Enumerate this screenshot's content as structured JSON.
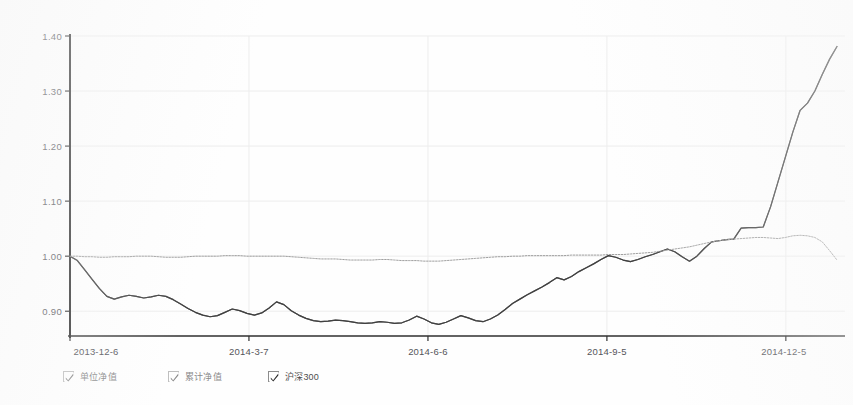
{
  "chart_data": {
    "type": "line",
    "title": "",
    "xlabel": "",
    "ylabel": "",
    "ylim": [
      0.855,
      1.4
    ],
    "xlim": [
      "2013-12-6",
      "2014-12-19"
    ],
    "grid": true,
    "legend_position": "bottom",
    "y_ticks": [
      "1.40",
      "1.30",
      "1.20",
      "1.10",
      "1.00",
      "0.90"
    ],
    "y_tick_values": [
      1.4,
      1.3,
      1.2,
      1.1,
      1.0,
      0.9
    ],
    "x_ticks": [
      "2013-12-6",
      "2014-3-7",
      "2014-6-6",
      "2014-9-5",
      "2014-12-5"
    ],
    "x_tick_positions": [
      0.0,
      0.2333,
      0.4667,
      0.7,
      0.9333
    ],
    "series": [
      {
        "name": "单位净值",
        "style": "solid",
        "color": "#3d3d3d",
        "values": [
          1.0,
          0.992,
          0.975,
          0.958,
          0.941,
          0.927,
          0.922,
          0.926,
          0.929,
          0.927,
          0.924,
          0.926,
          0.929,
          0.927,
          0.921,
          0.913,
          0.905,
          0.898,
          0.893,
          0.89,
          0.892,
          0.898,
          0.904,
          0.901,
          0.896,
          0.893,
          0.897,
          0.906,
          0.917,
          0.912,
          0.901,
          0.893,
          0.887,
          0.883,
          0.881,
          0.882,
          0.884,
          0.883,
          0.881,
          0.879,
          0.878,
          0.879,
          0.881,
          0.88,
          0.878,
          0.879,
          0.884,
          0.891,
          0.886,
          0.879,
          0.876,
          0.88,
          0.886,
          0.892,
          0.888,
          0.883,
          0.881,
          0.886,
          0.893,
          0.903,
          0.914,
          0.922,
          0.93,
          0.937,
          0.944,
          0.952,
          0.961,
          0.957,
          0.963,
          0.972,
          0.979,
          0.986,
          0.994,
          1.001,
          0.998,
          0.993,
          0.99,
          0.994,
          0.999,
          1.003,
          1.008,
          1.013,
          1.008,
          0.999,
          0.991,
          1.0,
          1.014,
          1.026,
          1.028,
          1.03,
          1.031,
          1.051,
          1.052,
          1.052,
          1.053,
          1.09,
          1.135,
          1.18,
          1.225,
          1.265,
          1.278,
          1.3,
          1.33,
          1.358,
          1.381
        ]
      },
      {
        "name": "累计净值",
        "style": "solid",
        "color": "#3d3d3d",
        "values": [
          1.0,
          0.992,
          0.975,
          0.958,
          0.941,
          0.927,
          0.922,
          0.926,
          0.929,
          0.927,
          0.924,
          0.926,
          0.929,
          0.927,
          0.921,
          0.913,
          0.905,
          0.898,
          0.893,
          0.89,
          0.892,
          0.898,
          0.904,
          0.901,
          0.896,
          0.893,
          0.897,
          0.906,
          0.917,
          0.912,
          0.901,
          0.893,
          0.887,
          0.883,
          0.881,
          0.882,
          0.884,
          0.883,
          0.881,
          0.879,
          0.878,
          0.879,
          0.881,
          0.88,
          0.878,
          0.879,
          0.884,
          0.891,
          0.886,
          0.879,
          0.876,
          0.88,
          0.886,
          0.892,
          0.888,
          0.883,
          0.881,
          0.886,
          0.893,
          0.903,
          0.914,
          0.922,
          0.93,
          0.937,
          0.944,
          0.952,
          0.961,
          0.957,
          0.963,
          0.972,
          0.979,
          0.986,
          0.994,
          1.001,
          0.998,
          0.993,
          0.99,
          0.994,
          0.999,
          1.003,
          1.008,
          1.013,
          1.008,
          0.999,
          0.991,
          1.0,
          1.014,
          1.026,
          1.028,
          1.03,
          1.031,
          1.051,
          1.052,
          1.052,
          1.053,
          1.09,
          1.135,
          1.18,
          1.225,
          1.265,
          1.278,
          1.3,
          1.33,
          1.358,
          1.381
        ]
      },
      {
        "name": "沪深300",
        "style": "dotted",
        "color": "#9a9a9a",
        "values": [
          1.0,
          1.0,
          0.999,
          0.999,
          0.998,
          0.998,
          0.999,
          0.999,
          0.999,
          1.0,
          1.0,
          1.0,
          0.999,
          0.998,
          0.998,
          0.998,
          0.999,
          1.0,
          1.0,
          1.0,
          1.0,
          1.001,
          1.001,
          1.001,
          1.0,
          1.0,
          1.0,
          1.0,
          1.0,
          1.0,
          0.999,
          0.998,
          0.997,
          0.996,
          0.995,
          0.995,
          0.995,
          0.994,
          0.993,
          0.993,
          0.993,
          0.993,
          0.994,
          0.994,
          0.993,
          0.992,
          0.992,
          0.992,
          0.991,
          0.991,
          0.991,
          0.992,
          0.993,
          0.994,
          0.995,
          0.996,
          0.997,
          0.998,
          0.999,
          0.999,
          1.0,
          1.0,
          1.001,
          1.001,
          1.001,
          1.001,
          1.001,
          1.001,
          1.002,
          1.002,
          1.002,
          1.002,
          1.002,
          1.003,
          1.003,
          1.003,
          1.004,
          1.005,
          1.006,
          1.007,
          1.009,
          1.011,
          1.013,
          1.015,
          1.017,
          1.02,
          1.023,
          1.026,
          1.028,
          1.03,
          1.031,
          1.032,
          1.033,
          1.034,
          1.034,
          1.033,
          1.032,
          1.034,
          1.037,
          1.038,
          1.037,
          1.034,
          1.026,
          1.01,
          0.993
        ]
      }
    ]
  },
  "legend": {
    "items": [
      {
        "label": "单位净值",
        "checked": true,
        "dim": true
      },
      {
        "label": "累计净值",
        "checked": true,
        "dim": true
      },
      {
        "label": "沪深300",
        "checked": true,
        "dim": false
      }
    ]
  },
  "colors": {
    "axis": "#2f2f2f",
    "grid": "#ededed",
    "fund_line": "#3d3d3d",
    "benchmark_line": "#9a9a9a",
    "tick_text": "#55555a",
    "background": "#ffffff"
  }
}
